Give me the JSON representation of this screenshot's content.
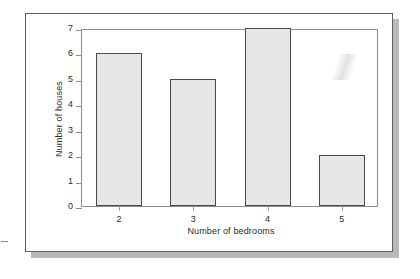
{
  "figure": {
    "frame_border_color": "#5e5e5e",
    "shadow_color": "#b9b9b9",
    "background": "#ffffff"
  },
  "chart_data": {
    "type": "bar",
    "title": "",
    "subtitle": "",
    "xlabel": "Number of bedrooms",
    "ylabel": "Number of houses",
    "categories": [
      "2",
      "3",
      "4",
      "5"
    ],
    "values": [
      6,
      5,
      7,
      2
    ],
    "ylim": [
      0,
      7
    ],
    "yticks": [
      "0",
      "1",
      "2",
      "3",
      "4",
      "5",
      "6",
      "7"
    ],
    "xticks": [
      "2",
      "3",
      "4",
      "5"
    ],
    "grid": false,
    "legend": null,
    "annotations": [],
    "bar_fill_color": "#e7e7e7",
    "bar_border_color": "#4a4a4a",
    "axis_color": "#8d8d8d"
  }
}
